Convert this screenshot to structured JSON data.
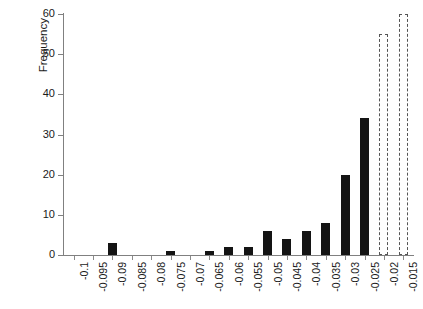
{
  "chart_data": {
    "type": "bar",
    "title": "",
    "subtitle": "",
    "xlabel": "",
    "ylabel": "Frequency",
    "ylim": [
      0,
      60
    ],
    "ytick_labels": [
      "0",
      "10",
      "20",
      "30",
      "40",
      "50",
      "60"
    ],
    "ytick_values": [
      0,
      10,
      20,
      30,
      40,
      50,
      60
    ],
    "grid": false,
    "legend": "none",
    "categories": [
      "-0.1",
      "-0.095",
      "-0.09",
      "-0.085",
      "-0.08",
      "-0.075",
      "-0.07",
      "-0.065",
      "-0.06",
      "-0.055",
      "-0.05",
      "-0.045",
      "-0.04",
      "-0.035",
      "-0.03",
      "-0.025",
      "-0.02",
      "-0.015"
    ],
    "values": [
      0,
      0,
      3,
      0,
      0,
      1,
      0,
      1,
      2,
      2,
      6,
      4,
      6,
      8,
      20,
      34,
      55,
      60
    ],
    "bar_styles": [
      "solid",
      "solid",
      "solid",
      "solid",
      "solid",
      "solid",
      "solid",
      "solid",
      "solid",
      "solid",
      "solid",
      "solid",
      "solid",
      "solid",
      "solid",
      "solid",
      "dashed",
      "dashed"
    ],
    "colors": {
      "bar_fill": "#141414",
      "dashed_outline": "#555555",
      "axis": "#808080",
      "text": "#1a1a1a",
      "background": "#ffffff"
    }
  }
}
